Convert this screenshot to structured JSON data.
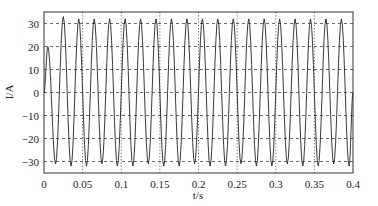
{
  "chart_data": {
    "type": "line",
    "title": "",
    "xlabel": "t/s",
    "ylabel": "I/A",
    "xlim": [
      0,
      0.4
    ],
    "ylim": [
      -35,
      35
    ],
    "x_ticks": [
      0,
      0.05,
      0.1,
      0.15,
      0.2,
      0.25,
      0.3,
      0.35,
      0.4
    ],
    "x_tick_labels": [
      "0",
      "0.05",
      "0.1",
      "0.15",
      "0.2",
      "0.25",
      "0.3",
      "0.35",
      "0.4"
    ],
    "y_ticks": [
      30,
      20,
      10,
      0,
      -10,
      -20,
      -30
    ],
    "y_tick_labels": [
      "30",
      "20",
      "10",
      "0",
      "−10",
      "−20",
      "−30"
    ],
    "grid": {
      "horizontal": "dashed",
      "vertical": "dotted"
    },
    "legend": null,
    "series": [
      {
        "name": "I",
        "frequency_hz": 50,
        "amplitude": 32,
        "peak_times_s": [
          0.005,
          0.025,
          0.045,
          0.065,
          0.085,
          0.105,
          0.125,
          0.145,
          0.165,
          0.185,
          0.205,
          0.225,
          0.245,
          0.265,
          0.285,
          0.305,
          0.325,
          0.345,
          0.365,
          0.385
        ],
        "peak_values": [
          20,
          33,
          32,
          32,
          32,
          32,
          32,
          32,
          32,
          32,
          32,
          32,
          32,
          32,
          32,
          32,
          32,
          32,
          32,
          32
        ],
        "trough_times_s": [
          0.015,
          0.035,
          0.055,
          0.075,
          0.095,
          0.115,
          0.135,
          0.155,
          0.175,
          0.195,
          0.215,
          0.235,
          0.255,
          0.275,
          0.295,
          0.315,
          0.335,
          0.355,
          0.375,
          0.395
        ],
        "trough_values": [
          -31,
          -32,
          -32,
          -31,
          -32,
          -32,
          -31,
          -32,
          -32,
          -31,
          -32,
          -32,
          -31,
          -32,
          -32,
          -31,
          -32,
          -32,
          -31,
          -32
        ]
      }
    ]
  }
}
